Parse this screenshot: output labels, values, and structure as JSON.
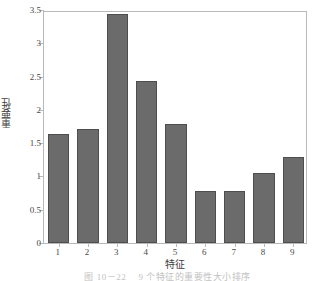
{
  "chart_data": {
    "type": "bar",
    "title": "",
    "xlabel": "特征",
    "ylabel": "重要性",
    "categories": [
      "1",
      "2",
      "3",
      "4",
      "5",
      "6",
      "7",
      "8",
      "9"
    ],
    "values": [
      1.64,
      1.71,
      3.44,
      2.43,
      1.79,
      0.78,
      0.78,
      1.05,
      1.29
    ],
    "ylim": [
      0,
      3.5
    ],
    "yticks": [
      "0",
      "0.5",
      "1",
      "1.5",
      "2",
      "2.5",
      "3",
      "3.5"
    ],
    "ytick_values": [
      0,
      0.5,
      1,
      1.5,
      2,
      2.5,
      3,
      3.5
    ],
    "grid": false,
    "legend": null,
    "bar_color": "#6b6b6b",
    "bar_edge_color": "#4e4e4e",
    "axis_color": "#b9b9b9",
    "background": "#ffffff"
  },
  "caption": {
    "text": "图 10－22　 9 个特征的重要性大小排序"
  }
}
